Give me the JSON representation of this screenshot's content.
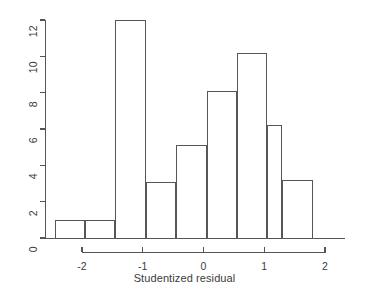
{
  "chart_data": {
    "type": "bar",
    "title": "",
    "subtitle": "",
    "xlabel": "Studentized residual",
    "ylabel": "",
    "grid": false,
    "legend": null,
    "legend_position": "none",
    "xlim": [
      -2.4,
      2.4
    ],
    "ylim": [
      0,
      12
    ],
    "x_ticks": [
      -2,
      -1,
      0,
      1,
      2
    ],
    "x_tick_labels": [
      "-2",
      "-1",
      "0",
      "1",
      "2"
    ],
    "y_ticks": [
      0,
      2,
      4,
      6,
      8,
      10,
      12
    ],
    "y_tick_labels": [
      "0",
      "2",
      "4",
      "6",
      "8",
      "10",
      "12"
    ],
    "bin_width": 0.5,
    "bin_edges": [
      -2.45,
      -1.95,
      -1.45,
      -0.95,
      -0.45,
      0.05,
      0.55,
      1.05,
      1.3,
      1.8
    ],
    "categories": [
      "-2.45 to -1.95",
      "-1.95 to -1.45",
      "-1.45 to -0.95",
      "-0.95 to -0.45",
      "-0.45 to 0.05",
      "0.05 to 0.55",
      "0.55 to 1.05",
      "1.05 to 1.3",
      "1.3 to 1.8"
    ],
    "values": [
      1,
      1,
      12,
      3.1,
      5.1,
      8.1,
      10.2,
      6.2,
      3.2
    ],
    "bars": [
      {
        "label": "bin-1",
        "x0": -2.45,
        "x1": -1.95,
        "value": 1
      },
      {
        "label": "bin-2",
        "x0": -1.95,
        "x1": -1.45,
        "value": 1
      },
      {
        "label": "bin-3",
        "x0": -1.45,
        "x1": -0.95,
        "value": 12
      },
      {
        "label": "bin-4",
        "x0": -0.95,
        "x1": -0.45,
        "value": 3.1
      },
      {
        "label": "bin-5",
        "x0": -0.45,
        "x1": 0.05,
        "value": 5.1
      },
      {
        "label": "bin-6",
        "x0": 0.05,
        "x1": 0.55,
        "value": 8.1
      },
      {
        "label": "bin-7",
        "x0": 0.55,
        "x1": 1.05,
        "value": 10.2
      },
      {
        "label": "bin-8",
        "x0": 1.05,
        "x1": 1.3,
        "value": 6.2
      },
      {
        "label": "bin-9",
        "x0": 1.3,
        "x1": 1.8,
        "value": 3.2
      }
    ],
    "colors": {
      "bar_stroke": "#55555a",
      "bar_fill": "none",
      "axis": "#555558",
      "text": "#3b3b3d",
      "background": "#ffffff"
    }
  }
}
